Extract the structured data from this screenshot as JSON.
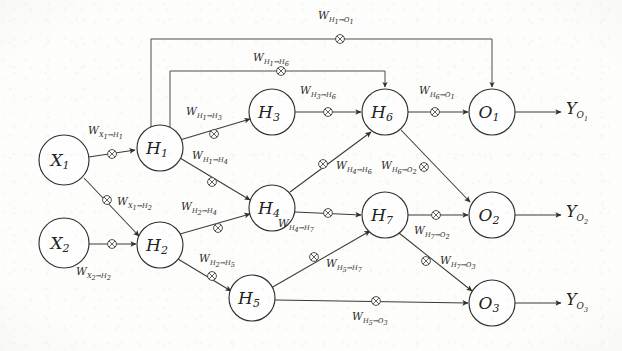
{
  "figure": {
    "type": "diagram",
    "width": 622,
    "height": 351,
    "background_color": "#fdfdfb",
    "ink_color": "#30302e"
  },
  "nodes": [
    {
      "id": "X1",
      "label": "X",
      "sub": "1",
      "layer": "input",
      "cx": 64,
      "cy": 160,
      "r": 25
    },
    {
      "id": "X2",
      "label": "X",
      "sub": "2",
      "layer": "input",
      "cx": 64,
      "cy": 243,
      "r": 25
    },
    {
      "id": "H1",
      "label": "H",
      "sub": "1",
      "layer": "hidden",
      "cx": 160,
      "cy": 148,
      "r": 23
    },
    {
      "id": "H2",
      "label": "H",
      "sub": "2",
      "layer": "hidden",
      "cx": 160,
      "cy": 245,
      "r": 23
    },
    {
      "id": "H3",
      "label": "H",
      "sub": "3",
      "layer": "hidden",
      "cx": 272,
      "cy": 112,
      "r": 23
    },
    {
      "id": "H4",
      "label": "H",
      "sub": "4",
      "layer": "hidden",
      "cx": 272,
      "cy": 208,
      "r": 23
    },
    {
      "id": "H5",
      "label": "H",
      "sub": "5",
      "layer": "hidden",
      "cx": 252,
      "cy": 298,
      "r": 23
    },
    {
      "id": "H6",
      "label": "H",
      "sub": "6",
      "layer": "hidden",
      "cx": 385,
      "cy": 112,
      "r": 23
    },
    {
      "id": "H7",
      "label": "H",
      "sub": "7",
      "layer": "hidden",
      "cx": 385,
      "cy": 215,
      "r": 23
    },
    {
      "id": "O1",
      "label": "O",
      "sub": "1",
      "layer": "output",
      "cx": 492,
      "cy": 112,
      "r": 23
    },
    {
      "id": "O2",
      "label": "O",
      "sub": "2",
      "layer": "output",
      "cx": 492,
      "cy": 215,
      "r": 23
    },
    {
      "id": "O3",
      "label": "O",
      "sub": "3",
      "layer": "output",
      "cx": 492,
      "cy": 303,
      "r": 23
    }
  ],
  "weights": [
    {
      "id": "w-x1-h1",
      "w": "W",
      "from": "X",
      "from_sub": "1",
      "to": "H",
      "to_sub": "1",
      "x": 88,
      "y": 125
    },
    {
      "id": "w-x1-h2",
      "w": "W",
      "from": "X",
      "from_sub": "1",
      "to": "H",
      "to_sub": "2",
      "x": 117,
      "y": 200
    },
    {
      "id": "w-x2-h2",
      "w": "W",
      "from": "X",
      "from_sub": "2",
      "to": "H",
      "to_sub": "2",
      "x": 76,
      "y": 270
    },
    {
      "id": "w-h1-h3",
      "w": "W",
      "from": "H",
      "from_sub": "1",
      "to": "H",
      "to_sub": "3",
      "x": 186,
      "y": 110
    },
    {
      "id": "w-h1-h4",
      "w": "W",
      "from": "H",
      "from_sub": "1",
      "to": "H",
      "to_sub": "4",
      "x": 192,
      "y": 154
    },
    {
      "id": "w-h2-h4",
      "w": "W",
      "from": "H",
      "from_sub": "2",
      "to": "H",
      "to_sub": "4",
      "x": 183,
      "y": 205
    },
    {
      "id": "w-h2-h5",
      "w": "W",
      "from": "H",
      "from_sub": "2",
      "to": "H",
      "to_sub": "5",
      "x": 200,
      "y": 257
    },
    {
      "id": "w-h3-h6",
      "w": "W",
      "from": "H",
      "from_sub": "3",
      "to": "H",
      "to_sub": "6",
      "x": 300,
      "y": 89
    },
    {
      "id": "w-h4-h6",
      "w": "W",
      "from": "H",
      "from_sub": "4",
      "to": "H",
      "to_sub": "6",
      "x": 335,
      "y": 163
    },
    {
      "id": "w-h4-h7",
      "w": "W",
      "from": "H",
      "from_sub": "4",
      "to": "H",
      "to_sub": "7",
      "x": 280,
      "y": 222
    },
    {
      "id": "w-h5-h7",
      "w": "W",
      "from": "H",
      "from_sub": "5",
      "to": "H",
      "to_sub": "7",
      "x": 325,
      "y": 262
    },
    {
      "id": "w-h5-o3",
      "w": "W",
      "from": "H",
      "from_sub": "5",
      "to": "O",
      "to_sub": "3",
      "x": 355,
      "y": 313
    },
    {
      "id": "w-h6-o1",
      "w": "W",
      "from": "H",
      "from_sub": "6",
      "to": "O",
      "to_sub": "1",
      "x": 420,
      "y": 89
    },
    {
      "id": "w-h6-o2",
      "w": "W",
      "from": "H",
      "from_sub": "6",
      "to": "O",
      "to_sub": "2",
      "x": 385,
      "y": 158
    },
    {
      "id": "w-h7-o2",
      "w": "W",
      "from": "H",
      "from_sub": "7",
      "to": "O",
      "to_sub": "2",
      "x": 418,
      "y": 228
    },
    {
      "id": "w-h7-o3",
      "w": "W",
      "from": "H",
      "from_sub": "7",
      "to": "O",
      "to_sub": "3",
      "x": 444,
      "y": 258
    },
    {
      "id": "w-h1-h6",
      "w": "W",
      "from": "H",
      "from_sub": "1",
      "to": "H",
      "to_sub": "6",
      "x": 258,
      "y": 56
    },
    {
      "id": "w-h1-o1",
      "w": "W",
      "from": "H",
      "from_sub": "1",
      "to": "O",
      "to_sub": "1",
      "x": 322,
      "y": 9
    }
  ],
  "outputs": [
    {
      "id": "y-o1",
      "label": "Y",
      "sub": "O",
      "subsub": "1",
      "x": 568,
      "y": 102
    },
    {
      "id": "y-o2",
      "label": "Y",
      "sub": "O",
      "subsub": "2",
      "x": 568,
      "y": 205
    },
    {
      "id": "y-o3",
      "label": "Y",
      "sub": "O",
      "subsub": "3",
      "x": 568,
      "y": 293
    }
  ],
  "multiplier_symbol": "circled-times",
  "arrow_symbol": "filled-triangle"
}
